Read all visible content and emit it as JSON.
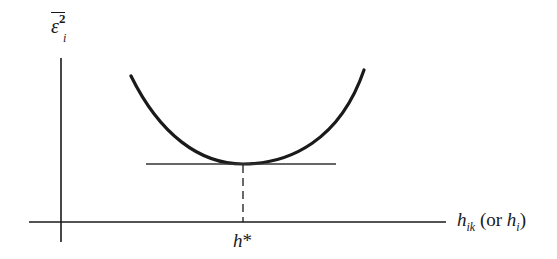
{
  "diagram": {
    "type": "function-minimum-plot",
    "y_axis_label": {
      "symbol": "ε",
      "superscript": "2",
      "subscript": "i",
      "overline": true,
      "text": "ε̄²ᵢ (mean squared error)"
    },
    "x_axis_label": {
      "main_symbol": "h",
      "main_subscript": "ik",
      "alt_prefix": "(or ",
      "alt_symbol": "h",
      "alt_subscript": "i",
      "alt_suffix": ")"
    },
    "minimum_label": {
      "symbol": "h",
      "suffix": "*"
    },
    "colors": {
      "line": "#1a1a1a",
      "background": "#ffffff"
    }
  }
}
